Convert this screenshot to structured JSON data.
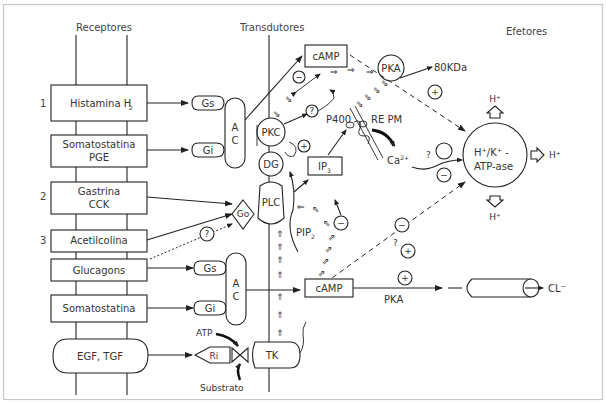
{
  "headers": {
    "receptors": "Receptores",
    "transducers": "Transdutores",
    "effectors": "Efetores"
  },
  "row_numbers": [
    "1",
    "2",
    "3"
  ],
  "receptors": [
    {
      "line1": "Histamina H",
      "sub": "2",
      "line2": ""
    },
    {
      "line1": "Somatostatina",
      "line2": "PGE"
    },
    {
      "line1": "Gastrina",
      "line2": "CCK"
    },
    {
      "line1": "Acetilcolina",
      "line2": ""
    },
    {
      "line1": "Glucagons",
      "line2": ""
    },
    {
      "line1": "Somatostatina",
      "line2": ""
    },
    {
      "line1": "EGF, TGF",
      "line2": ""
    }
  ],
  "transducers": {
    "gs_top": "Gs",
    "gi_top": "Gi",
    "ac_top_a": "A",
    "ac_top_c": "C",
    "go": "Go",
    "gs_bottom": "Gs",
    "gi_bottom": "Gi",
    "ac_bottom_a": "A",
    "ac_bottom_c": "C",
    "ri": "Ri",
    "atp": "ATP",
    "substrate": "Substrato",
    "pkc": "PKC",
    "dg": "DG",
    "plc": "PLC",
    "tk": "TK",
    "unknown": "?"
  },
  "effectors": {
    "camp_top": "cAMP",
    "pka": "PKA",
    "kda": "80KDa",
    "p400": "P400",
    "re_pm": "RE PM",
    "ip3": "IP",
    "ip3_sub": "3",
    "pip2": "PIP",
    "pip2_sub": "2",
    "ca": "Ca",
    "ca_sup": "2+",
    "pump_line1": "H⁺/K⁺ -",
    "pump_line2": "ATP-ase",
    "h_top": "H⁺",
    "h_right": "H⁺",
    "h_bottom": "H⁺",
    "camp_bottom": "cAMP",
    "pka_bottom": "PKA",
    "cl": "CL⁻",
    "plus": "+",
    "minus": "−",
    "question": "?"
  }
}
